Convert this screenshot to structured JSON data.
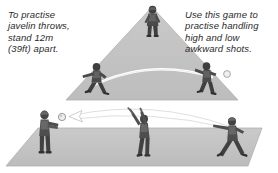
{
  "illustration": {
    "title": "Javelin throw and handling practice drills",
    "background_color": "#ffffff"
  },
  "captions": {
    "left": {
      "text": "To practise\njavelin throws,\nstand 12m\n(39ft) apart.",
      "distance_metric": "12m",
      "distance_imperial": "39ft",
      "color": "#2b2b2b"
    },
    "right": {
      "text": "Use this game to\npractise handling\nhigh and low\nawkward shots.",
      "color": "#2b2b2b"
    }
  },
  "scenes": [
    {
      "id": "javelin-drill",
      "name": "Triangular pitch javelin drill",
      "pitch_shape": "triangle",
      "pitch_color": "#c4c4c4",
      "pitch_edge_color": "#a8a8a8",
      "players": [
        {
          "id": "apex-player",
          "label": "Player at apex",
          "pose": "running"
        },
        {
          "id": "left-player",
          "label": "Player at left base",
          "pose": "throwing-run"
        },
        {
          "id": "right-player",
          "label": "Player at right base",
          "pose": "catching"
        }
      ],
      "trajectory": {
        "label": "Ball flight arc",
        "color": "#ffffff",
        "direction": "left-to-right"
      },
      "ball": {
        "label": "Ball",
        "color": "#f2f2f2"
      }
    },
    {
      "id": "handling-drill",
      "name": "Rectangular pitch handling drill",
      "pitch_shape": "parallelogram",
      "pitch_color": "#c4c4c4",
      "pitch_edge_color": "#a8a8a8",
      "players": [
        {
          "id": "thrower-left",
          "label": "Player receiving",
          "pose": "arms-forward"
        },
        {
          "id": "keeper-center",
          "label": "Goalkeeper leaping",
          "pose": "jump-catch"
        },
        {
          "id": "thrower-right",
          "label": "Player throwing",
          "pose": "throwing-lunge"
        }
      ],
      "trajectory": {
        "label": "Ball flight arcs",
        "color": "#ffffff",
        "direction": "right-to-left",
        "arrowhead": true
      },
      "ball": {
        "label": "Ball",
        "color": "#f2f2f2"
      }
    }
  ],
  "palette": {
    "pitch": "#c4c4c4",
    "pitch_dark": "#b3b3b3",
    "figure_dark": "#3c3c3c",
    "figure_mid": "#6a6a6a",
    "figure_light": "#9a9a9a",
    "arrow": "#ffffff",
    "arrow_outline": "#7d7d7d",
    "text": "#2b2b2b"
  }
}
